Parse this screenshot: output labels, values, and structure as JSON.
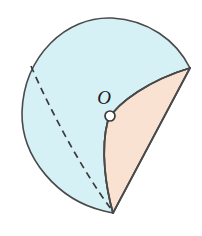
{
  "figure": {
    "kind": "solid-geometry-diagram",
    "background_color": "#ffffff",
    "labels": [
      {
        "name": "center-point-label",
        "text": "O",
        "x": 104,
        "y": 104,
        "style": "italic"
      }
    ],
    "points": [
      {
        "name": "center-point-marker",
        "label": "O",
        "x": 110,
        "y": 116,
        "radius": 5,
        "fill": "#ffffff",
        "stroke": "#3a3a3a"
      }
    ],
    "regions": [
      {
        "name": "sphere-surface-region",
        "role": "remaining-spherical-surface",
        "fill": "#d6f1f6",
        "stroke": "#4a4a4a"
      },
      {
        "name": "cone-surface-region",
        "role": "exposed-conical-surface",
        "fill": "#fae2d2",
        "stroke": "#4a4a4a"
      }
    ],
    "edges": [
      {
        "name": "sphere-outline-arc",
        "style": "solid",
        "stroke": "#4a4a4a"
      },
      {
        "name": "cone-slant-edge",
        "style": "solid",
        "stroke": "#4a4a4a"
      },
      {
        "name": "cone-rim-arc",
        "style": "solid",
        "stroke": "#4a4a4a"
      },
      {
        "name": "hidden-great-circle-arc",
        "style": "dashed",
        "stroke": "#3a3a3a",
        "dash_pattern": "7 5"
      }
    ],
    "geometry_values": {
      "sphere_center_x": 105,
      "sphere_center_y": 115,
      "sphere_radius_x": 83,
      "sphere_radius_y": 97,
      "cone_apex_x": 190,
      "cone_apex_y": 68,
      "bottom_vertex_x": 113,
      "bottom_vertex_y": 213
    },
    "colors": {
      "sphere_fill": "#d6f1f6",
      "cone_fill": "#fae2d2",
      "outline": "#4a4a4a",
      "dashed": "#3a3a3a",
      "label": "#1c1c1c"
    }
  }
}
